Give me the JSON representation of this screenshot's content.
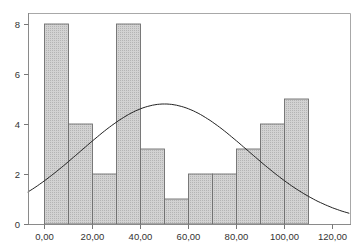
{
  "chart_data": {
    "type": "bar",
    "subtype": "histogram",
    "title": "",
    "xlabel": "",
    "ylabel": "",
    "bins": [
      {
        "start": 0,
        "end": 10,
        "count": 8
      },
      {
        "start": 10,
        "end": 20,
        "count": 4
      },
      {
        "start": 20,
        "end": 30,
        "count": 2
      },
      {
        "start": 30,
        "end": 40,
        "count": 8
      },
      {
        "start": 40,
        "end": 50,
        "count": 3
      },
      {
        "start": 50,
        "end": 60,
        "count": 1
      },
      {
        "start": 60,
        "end": 70,
        "count": 2
      },
      {
        "start": 70,
        "end": 80,
        "count": 2
      },
      {
        "start": 80,
        "end": 90,
        "count": 3
      },
      {
        "start": 90,
        "end": 100,
        "count": 4
      },
      {
        "start": 100,
        "end": 110,
        "count": 5
      }
    ],
    "categories": [
      "0-10",
      "10-20",
      "20-30",
      "30-40",
      "40-50",
      "50-60",
      "60-70",
      "70-80",
      "80-90",
      "90-100",
      "100-110"
    ],
    "values": [
      8,
      4,
      2,
      8,
      3,
      1,
      2,
      2,
      3,
      4,
      5
    ],
    "overlay": {
      "type": "normal_curve",
      "mean": 50,
      "sd": 35,
      "peak": 4.8
    },
    "xlim": [
      -7,
      127
    ],
    "ylim": [
      0,
      8.4
    ],
    "x_ticks": [
      "0,00",
      "20,00",
      "40,00",
      "60,00",
      "80,00",
      "100,00",
      "120,00"
    ],
    "x_tick_values": [
      0,
      20,
      40,
      60,
      80,
      100,
      120
    ],
    "y_ticks": [
      "0",
      "2",
      "4",
      "6",
      "8"
    ],
    "y_tick_values": [
      0,
      2,
      4,
      6,
      8
    ],
    "grid": false,
    "legend": null
  },
  "colors": {
    "bar_fill": "#c9c9c9",
    "bar_edge": "#6e6e6e",
    "curve": "#222222",
    "frame": "#a0a0a0",
    "axis": "#777777"
  }
}
